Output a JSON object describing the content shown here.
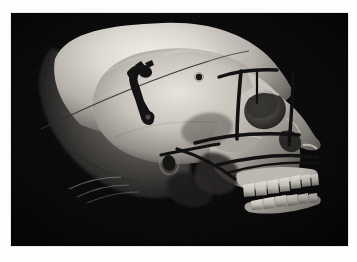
{
  "page": {
    "background_color": "#fdfdfd",
    "width": 357,
    "height": 262
  },
  "figure": {
    "name": "skull-lateral-photograph",
    "media_type": "photograph",
    "color_mode": "grayscale",
    "background_color": "#030303",
    "plate": {
      "x": 11,
      "y": 13,
      "width": 337,
      "height": 233
    },
    "annotations": {
      "marker_color": "#0c0c0c",
      "thin_line_color": "#2a2a2a",
      "items": [
        {
          "id": "parietal-bracket-marker",
          "label": "bracket marker on parietal bone"
        },
        {
          "id": "burr-hole",
          "label": "small circular hole"
        },
        {
          "id": "coronal-thin-line",
          "label": "thin line across cranial vault"
        },
        {
          "id": "orbital-frame-line",
          "label": "vertical line anterior to orbit"
        },
        {
          "id": "supraorbital-line",
          "label": "horizontal line above orbit"
        },
        {
          "id": "infraorbital-line",
          "label": "horizontal line below orbit"
        },
        {
          "id": "maxillary-line",
          "label": "horizontal line across maxilla"
        },
        {
          "id": "zygomatic-oblique-line",
          "label": "oblique line across zygomatic arch"
        },
        {
          "id": "occlusal-line",
          "label": "line along occlusal plane"
        }
      ]
    },
    "anatomy_labels": [
      "cranial vault",
      "frontal bone",
      "orbit",
      "nasal aperture",
      "zygomatic arch",
      "external auditory meatus",
      "maxilla with upper teeth",
      "mandible with lower teeth",
      "occipital region"
    ]
  },
  "caption": {
    "text": "",
    "visible": false,
    "note": "caption row cropped at page bottom; glyph tops only"
  },
  "colors": {
    "page_background": "#fdfdfd",
    "photo_background": "#030303",
    "bone_highlight": "#f2efe9",
    "bone_midtone": "#b9b4ad",
    "bone_shadow": "#55514c",
    "marker_black": "#0c0c0c",
    "plate_border": "#e8e8e8"
  }
}
